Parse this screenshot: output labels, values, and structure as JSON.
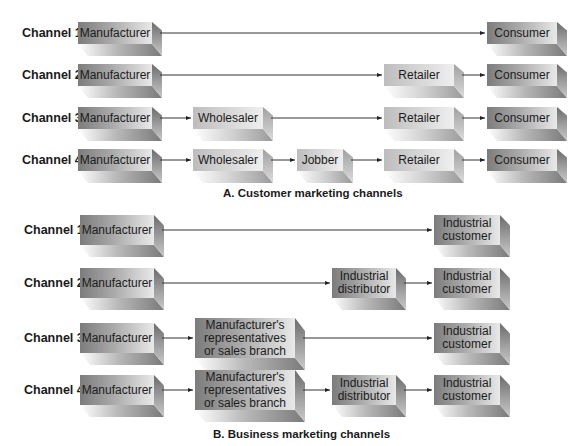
{
  "section_a": {
    "caption": "A. Customer marketing channels",
    "channels": [
      {
        "label": "Channel 1",
        "nodes": [
          "Manufacturer",
          "Consumer"
        ]
      },
      {
        "label": "Channel 2",
        "nodes": [
          "Manufacturer",
          "Retailer",
          "Consumer"
        ]
      },
      {
        "label": "Channel 3",
        "nodes": [
          "Manufacturer",
          "Wholesaler",
          "Retailer",
          "Consumer"
        ]
      },
      {
        "label": "Channel 4",
        "nodes": [
          "Manufacturer",
          "Wholesaler",
          "Jobber",
          "Retailer",
          "Consumer"
        ]
      }
    ]
  },
  "section_b": {
    "caption": "B. Business marketing channels",
    "channels": [
      {
        "label": "Channel 1",
        "nodes": [
          "Manufacturer",
          "Industrial customer"
        ]
      },
      {
        "label": "Channel 2",
        "nodes": [
          "Manufacturer",
          "Industrial distributor",
          "Industrial customer"
        ]
      },
      {
        "label": "Channel 3",
        "nodes": [
          "Manufacturer",
          "Manufacturer's representatives or sales branch",
          "Industrial customer"
        ]
      },
      {
        "label": "Channel 4",
        "nodes": [
          "Manufacturer",
          "Manufacturer's representatives or sales branch",
          "Industrial distributor",
          "Industrial customer"
        ]
      }
    ]
  },
  "node_text": {
    "manufacturer": "Manufacturer",
    "wholesaler": "Wholesaler",
    "jobber": "Jobber",
    "retailer": "Retailer",
    "consumer": "Consumer",
    "industrial_customer_1": "Industrial",
    "industrial_customer_2": "customer",
    "industrial_distributor_1": "Industrial",
    "industrial_distributor_2": "distributor",
    "mfr_reps_1": "Manufacturer's",
    "mfr_reps_2": "representatives",
    "mfr_reps_3": "or sales branch"
  }
}
